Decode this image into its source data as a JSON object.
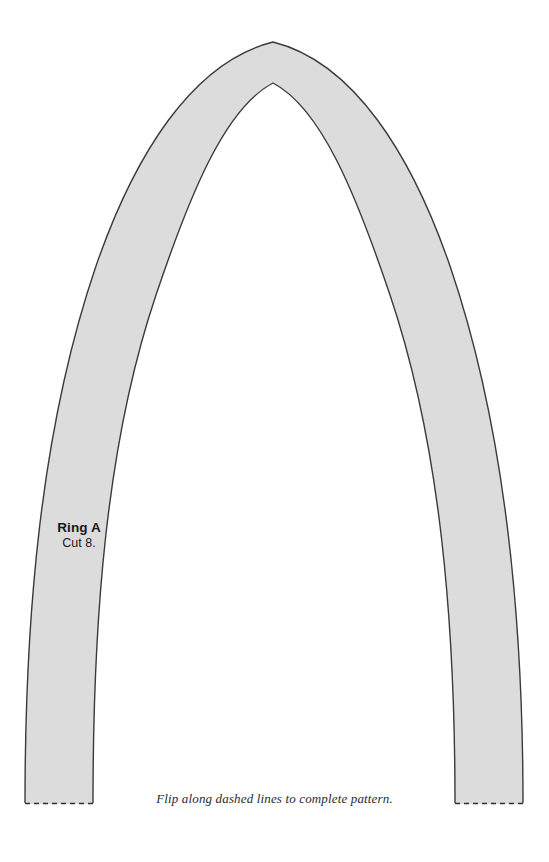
{
  "document": {
    "kind": "sewing-pattern-template",
    "background_color": "#ffffff",
    "width": 549,
    "height": 862
  },
  "pattern": {
    "name": "Ring A",
    "piece_label": "Ring A",
    "cut_instruction": "Cut 8.",
    "fill_color": "#dcdcdc",
    "stroke_color": "#3a3a3a",
    "stroke_width": 1.3,
    "shape": "parabolic-arch-band",
    "outer_apex": {
      "x": 273,
      "y": 42
    },
    "inner_apex": {
      "x": 273,
      "y": 83
    },
    "left_leg_bottom": {
      "outer_x": 25,
      "inner_x": 93,
      "y": 804
    },
    "right_leg_bottom": {
      "inner_x": 455,
      "outer_x": 523,
      "y": 804
    },
    "fold_edge_style": "dashed",
    "fold_dash_pattern": "5 4",
    "fold_line_y": 803
  },
  "footer": {
    "note": "Flip along dashed lines to complete pattern."
  }
}
